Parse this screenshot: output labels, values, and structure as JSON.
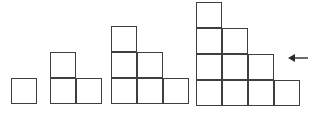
{
  "diagram": {
    "type": "geometric-growth-pattern",
    "background_color": "#ffffff",
    "stroke_color": "#3f3f3f",
    "stroke_width_px": 1.6,
    "canvas": {
      "width": 319,
      "height": 115
    },
    "cell_size_px": 26,
    "baseline_y": 104,
    "figures": [
      {
        "index": 1,
        "name": "figure-1",
        "label": "",
        "square_count": 1,
        "steps": 1,
        "column_heights": [
          1
        ],
        "origin": {
          "x": 11,
          "y": 78
        },
        "width_px": 26,
        "height_px": 26,
        "cells": [
          {
            "col": 0,
            "row": 0
          }
        ]
      },
      {
        "index": 2,
        "name": "figure-2",
        "label": "",
        "square_count": 3,
        "steps": 2,
        "column_heights": [
          2,
          1
        ],
        "origin": {
          "x": 50,
          "y": 52
        },
        "width_px": 52,
        "height_px": 52,
        "cells": [
          {
            "col": 0,
            "row": 0
          },
          {
            "col": 0,
            "row": 1
          },
          {
            "col": 1,
            "row": 1
          }
        ]
      },
      {
        "index": 3,
        "name": "figure-3",
        "label": "",
        "square_count": 6,
        "steps": 3,
        "column_heights": [
          3,
          2,
          1
        ],
        "origin": {
          "x": 111,
          "y": 26
        },
        "width_px": 78,
        "height_px": 78,
        "cells": [
          {
            "col": 0,
            "row": 0
          },
          {
            "col": 0,
            "row": 1
          },
          {
            "col": 1,
            "row": 1
          },
          {
            "col": 0,
            "row": 2
          },
          {
            "col": 1,
            "row": 2
          },
          {
            "col": 2,
            "row": 2
          }
        ]
      },
      {
        "index": 4,
        "name": "figure-4",
        "label": "",
        "square_count": 10,
        "steps": 4,
        "column_heights": [
          4,
          3,
          2,
          1
        ],
        "origin": {
          "x": 196,
          "y": 2
        },
        "width_px": 104,
        "height_px": 104,
        "cells": [
          {
            "col": 0,
            "row": 0
          },
          {
            "col": 0,
            "row": 1
          },
          {
            "col": 1,
            "row": 1
          },
          {
            "col": 0,
            "row": 2
          },
          {
            "col": 1,
            "row": 2
          },
          {
            "col": 2,
            "row": 2
          },
          {
            "col": 0,
            "row": 3
          },
          {
            "col": 1,
            "row": 3
          },
          {
            "col": 2,
            "row": 3
          },
          {
            "col": 3,
            "row": 3
          }
        ]
      }
    ],
    "annotation": {
      "name": "pointer-arrow",
      "icon": "arrow-left-icon",
      "direction": "left",
      "label": "",
      "points_at_figure": 4,
      "position": {
        "x": 288,
        "y": 52
      },
      "width_px": 21,
      "height_px": 12,
      "color": "#2b2b2b"
    }
  }
}
